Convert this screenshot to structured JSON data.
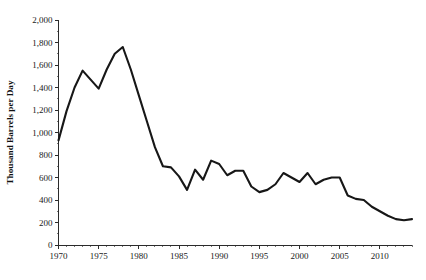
{
  "chart_data": {
    "type": "line",
    "title": "",
    "xlabel": "",
    "ylabel": "Thousand Barrels per Day",
    "xlim": [
      1970,
      2014
    ],
    "ylim": [
      0,
      2000
    ],
    "grid": false,
    "legend": "none",
    "y_ticks": [
      0,
      200,
      400,
      600,
      800,
      1000,
      1200,
      1400,
      1600,
      1800,
      2000
    ],
    "y_tick_labels": [
      "0",
      "200",
      "400",
      "600",
      "800",
      "1,000",
      "1,200",
      "1,400",
      "1,600",
      "1,800",
      "2,000"
    ],
    "x_ticks": [
      1970,
      1975,
      1980,
      1985,
      1990,
      1995,
      2000,
      2005,
      2010
    ],
    "x_tick_labels": [
      "1970",
      "1975",
      "1980",
      "1985",
      "1990",
      "1995",
      "2000",
      "2005",
      "2010"
    ],
    "x_minor_step": 1,
    "y_minor_step": 100,
    "line_color": "#171717",
    "series": [
      {
        "name": "Production",
        "x": [
          1970,
          1971,
          1972,
          1973,
          1974,
          1975,
          1976,
          1977,
          1978,
          1979,
          1980,
          1981,
          1982,
          1983,
          1984,
          1985,
          1986,
          1987,
          1988,
          1989,
          1990,
          1991,
          1992,
          1993,
          1994,
          1995,
          1996,
          1997,
          1998,
          1999,
          2000,
          2001,
          2002,
          2003,
          2004,
          2005,
          2006,
          2007,
          2008,
          2009,
          2010,
          2011,
          2012,
          2013,
          2014
        ],
        "values": [
          930,
          1190,
          1400,
          1550,
          1470,
          1390,
          1560,
          1700,
          1760,
          1560,
          1330,
          1100,
          870,
          700,
          690,
          610,
          490,
          670,
          580,
          750,
          720,
          620,
          660,
          660,
          520,
          470,
          490,
          540,
          640,
          600,
          560,
          640,
          540,
          580,
          600,
          600,
          440,
          410,
          400,
          340,
          300,
          260,
          230,
          220,
          230
        ]
      }
    ]
  }
}
